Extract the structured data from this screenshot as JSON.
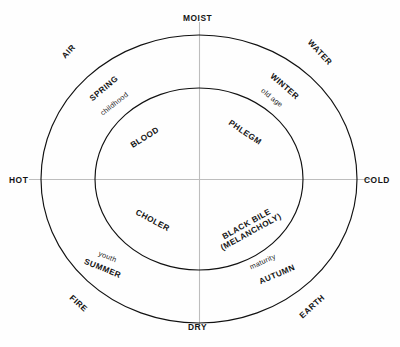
{
  "diagram": {
    "background_color": "#fefefe",
    "ring_stroke_color": "#111111",
    "axis_stroke_color": "#bdbdbd",
    "qualities": {
      "top": "MOIST",
      "bottom": "DRY",
      "left": "HOT",
      "right": "COLD"
    },
    "elements": {
      "upper_left": "AIR",
      "upper_right": "WATER",
      "lower_right": "EARTH",
      "lower_left": "FIRE"
    },
    "seasons": {
      "upper_left": "SPRING",
      "upper_right": "WINTER",
      "lower_right": "AUTUMN",
      "lower_left": "SUMMER"
    },
    "ages": {
      "upper_left": "childhood",
      "upper_right": "old age",
      "lower_right": "maturity",
      "lower_left": "youth"
    },
    "humours": {
      "upper_left": "BLOOD",
      "upper_right": "PHLEGM",
      "lower_right_line1": "BLACK BILE",
      "lower_right_line2": "(MELANCHOLY)",
      "lower_left": "CHOLER"
    }
  }
}
